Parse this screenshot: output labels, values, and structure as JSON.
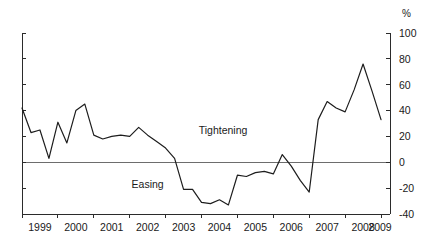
{
  "chart_data": {
    "type": "line",
    "title": "",
    "subtitle": "",
    "xlabel": "",
    "ylabel": "",
    "unit_label": "%",
    "ylim": [
      -40,
      100
    ],
    "ytick_values": [
      100,
      80,
      60,
      40,
      20,
      0,
      -20,
      -40
    ],
    "ytick_labels": [
      "100",
      "80",
      "60",
      "40",
      "20",
      "0",
      "-20",
      "-40"
    ],
    "y_axis_position": "right",
    "grid": false,
    "legend_position": "none",
    "zero_line": 0,
    "xlim": [
      1999.0,
      2009.25
    ],
    "xtick_values": [
      1999,
      2000,
      2001,
      2002,
      2003,
      2004,
      2005,
      2006,
      2007,
      2008,
      2009,
      2010
    ],
    "xtick_labels": [
      "1999",
      "2000",
      "2001",
      "2002",
      "2003",
      "2004",
      "2005",
      "2006",
      "2007",
      "2008",
      "2009"
    ],
    "x_label_positions": [
      1999.5,
      2000.5,
      2001.5,
      2002.5,
      2003.5,
      2004.5,
      2005.5,
      2006.5,
      2007.5,
      2008.5,
      2009.5
    ],
    "annotations": [
      {
        "text": "Tightening",
        "x": 2004.6,
        "y": 25
      },
      {
        "text": "Easing",
        "x": 2002.5,
        "y": -17
      }
    ],
    "series": [
      {
        "name": "Net percentage tightening standards",
        "color": "#1d1d1d",
        "x": [
          1999.0,
          1999.25,
          1999.5,
          1999.75,
          2000.0,
          2000.25,
          2000.5,
          2000.75,
          2001.0,
          2001.25,
          2001.5,
          2001.75,
          2002.0,
          2002.25,
          2002.5,
          2002.75,
          2003.0,
          2003.25,
          2003.5,
          2003.75,
          2004.0,
          2004.25,
          2004.5,
          2004.75,
          2005.0,
          2005.25,
          2005.5,
          2005.75,
          2006.0,
          2006.25,
          2006.5,
          2006.75,
          2007.0,
          2007.25,
          2007.5,
          2007.75,
          2008.0,
          2008.25,
          2008.5,
          2008.75,
          2009.0
        ],
        "values": [
          42,
          23,
          25,
          3,
          31,
          15,
          40,
          45,
          21,
          18,
          20,
          21,
          20,
          27,
          21,
          16,
          11,
          3,
          -21,
          -21,
          -31,
          -32,
          -29,
          -33,
          -10,
          -11,
          -8,
          -7,
          -9,
          6,
          -3,
          -14,
          -23,
          33,
          47,
          42,
          39,
          56,
          76,
          55,
          33
        ]
      }
    ]
  },
  "axis": {
    "unit": "%"
  }
}
